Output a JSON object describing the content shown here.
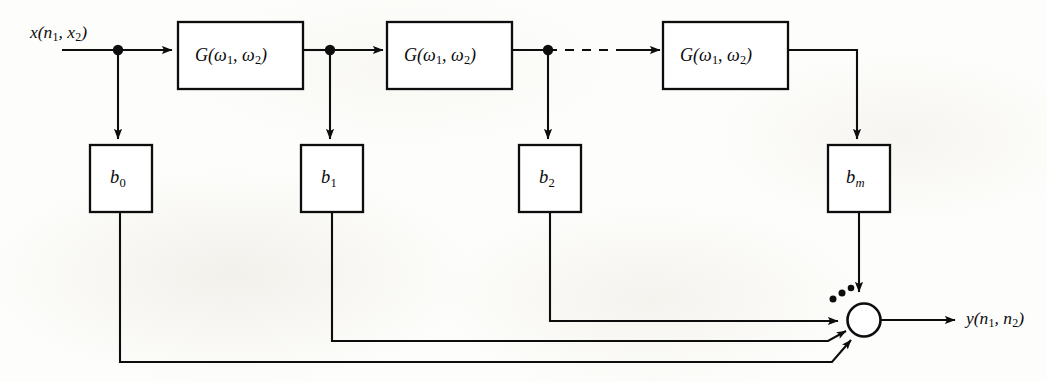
{
  "figure": {
    "kind": "block-diagram",
    "background_color": "#fdfdfb",
    "ink_color": "#0d0d0d"
  },
  "signals": {
    "input": {
      "name": "x",
      "arg1": "n",
      "arg1_sub": "1",
      "arg2": "x",
      "arg2_sub": "2",
      "text": "x(n1, x2)"
    },
    "output": {
      "name": "y",
      "arg1": "n",
      "arg1_sub": "1",
      "arg2": "n",
      "arg2_sub": "2",
      "text": "y(n1, n2)"
    }
  },
  "filter_blocks": [
    {
      "id": "g1",
      "name": "G",
      "arg1": "ω",
      "arg1_sub": "1",
      "arg2": "ω",
      "arg2_sub": "2",
      "text": "G(ω1, ω2)"
    },
    {
      "id": "g2",
      "name": "G",
      "arg1": "ω",
      "arg1_sub": "1",
      "arg2": "ω",
      "arg2_sub": "2",
      "text": "G(ω1, ω2)"
    },
    {
      "id": "g3",
      "name": "G",
      "arg1": "ω",
      "arg1_sub": "1",
      "arg2": "ω",
      "arg2_sub": "2",
      "text": "G(ω1, ω2)"
    }
  ],
  "coefficient_blocks": [
    {
      "id": "b0",
      "name": "b",
      "sub": "0",
      "sub_italic": false,
      "text": "b0"
    },
    {
      "id": "b1",
      "name": "b",
      "sub": "1",
      "sub_italic": false,
      "text": "b1"
    },
    {
      "id": "b2",
      "name": "b",
      "sub": "2",
      "sub_italic": false,
      "text": "b2"
    },
    {
      "id": "bm",
      "name": "b",
      "sub": "m",
      "sub_italic": true,
      "text": "bm"
    }
  ],
  "summing_node": {
    "id": "adder",
    "shape": "circle",
    "input_count_shown": 4,
    "has_ellipsis": true,
    "ellipsis_dots": 3
  },
  "continuation": {
    "top_rail_dashed": true,
    "meaning": "cascade continues"
  }
}
